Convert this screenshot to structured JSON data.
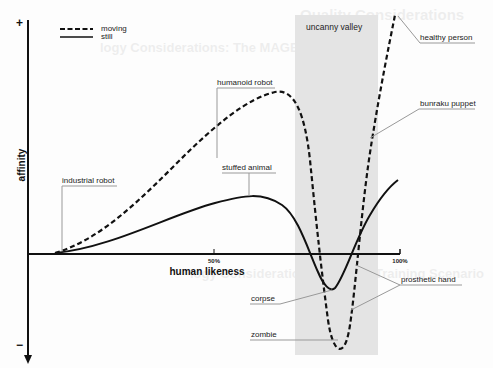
{
  "diagram": {
    "title": "Uncanny valley",
    "axes": {
      "y_label": "affinity",
      "y_top_symbol": "+",
      "y_bottom_symbol": "−",
      "x_label": "human likeness",
      "x_ticks": [
        "50%",
        "100%"
      ]
    },
    "legend": [
      {
        "label": "moving",
        "style": "dashed"
      },
      {
        "label": "still",
        "style": "solid"
      }
    ],
    "region": {
      "label": "uncanny valley",
      "x_range_pct": [
        72,
        94
      ],
      "color": "#e4e4e4"
    },
    "annotations": {
      "industrial_robot": "industrial robot",
      "humanoid_robot": "humanoid robot",
      "stuffed_animal": "stuffed animal",
      "healthy_person": "healthy person",
      "bunraku_puppet": "bunraku puppet",
      "prosthetic_hand": "prosthetic hand",
      "corpse": "corpse",
      "zombie": "zombie"
    },
    "curves": {
      "moving": {
        "x_pct": [
          7,
          20,
          35,
          50,
          60,
          65,
          68,
          72,
          76,
          80,
          84,
          88,
          92,
          95,
          99
        ],
        "affinity": [
          0.01,
          0.08,
          0.25,
          0.48,
          0.63,
          0.67,
          0.66,
          0.52,
          0.0,
          -0.75,
          -0.5,
          0.1,
          0.7,
          1.0,
          1.08
        ]
      },
      "still": {
        "x_pct": [
          7,
          20,
          35,
          50,
          60,
          65,
          70,
          75,
          78,
          80,
          83,
          87,
          92,
          99
        ],
        "affinity": [
          0.01,
          0.04,
          0.11,
          0.2,
          0.25,
          0.26,
          0.22,
          0.07,
          -0.06,
          -0.16,
          -0.16,
          -0.03,
          0.25,
          0.42
        ]
      }
    },
    "bleed_text": [
      "Quality Considerations",
      "logy Considerations: The MAGES Platform",
      "logy Considerations: Paraffin Training Scenario"
    ]
  }
}
